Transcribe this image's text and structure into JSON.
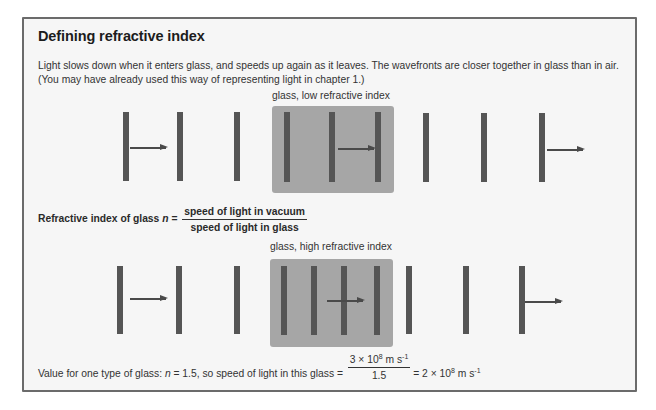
{
  "title": "Defining refractive index",
  "intro": "Light slows down when it enters glass, and speeds up again as it leaves. The wavefronts are closer together in glass than in air. (You may have already used this way of representing light in chapter 1.)",
  "diagram_low": {
    "caption": "glass, low refractive index",
    "wavefronts_in_glass": 3
  },
  "formula": {
    "label": "Refractive index of glass",
    "variable": "n",
    "equals": "=",
    "numerator": "speed of light in vacuum",
    "denominator": "speed of light in glass"
  },
  "diagram_high": {
    "caption": "glass, high refractive index",
    "wavefronts_in_glass": 4
  },
  "example": {
    "prefix": "Value for one type of glass: ",
    "variable": "n",
    "n_value": " = 1.5, so speed of light in this glass = ",
    "numerator_coef": "3 × 10",
    "numerator_exp": "8",
    "numerator_unit": " m s",
    "numerator_unit_exp": "-1",
    "denominator": "1.5",
    "result_coef": " = 2 × 10",
    "result_exp": "8",
    "result_unit": " m s",
    "result_unit_exp": "-1"
  }
}
